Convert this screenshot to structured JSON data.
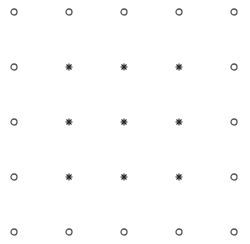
{
  "grid": {
    "columns_x": [
      14,
      69,
      124,
      179,
      234
    ],
    "rows_y": [
      12,
      67,
      122,
      177,
      232
    ],
    "colors": {
      "circle": "#555555",
      "star": "#222222",
      "background": "#ffffff"
    },
    "points": [
      [
        "circle",
        "circle",
        "circle",
        "circle",
        "circle"
      ],
      [
        "circle",
        "star",
        "star",
        "star",
        "circle"
      ],
      [
        "circle",
        "star",
        "star",
        "star",
        "circle"
      ],
      [
        "circle",
        "star",
        "star",
        "star",
        "circle"
      ],
      [
        "circle",
        "circle",
        "circle",
        "circle",
        "circle"
      ]
    ]
  }
}
